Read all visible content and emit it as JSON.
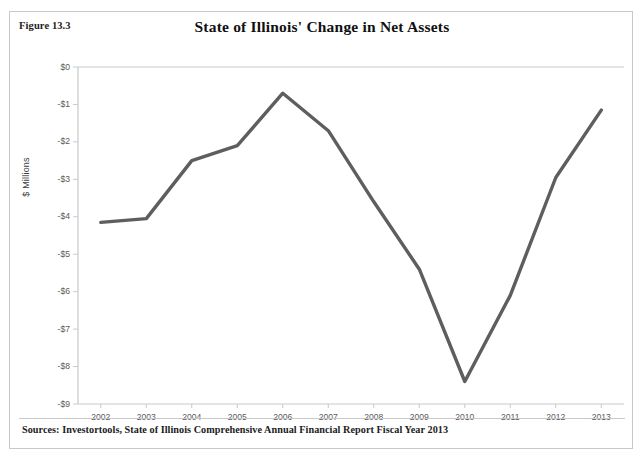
{
  "figure": {
    "label": "Figure 13.3",
    "title": "State of Illinois' Change in Net Assets",
    "sources": "Sources: Investortools, State of Illinois Comprehensive Annual Financial Report Fiscal Year 2013"
  },
  "style": {
    "line_color": "#5e5e5e",
    "axis_color": "#c9c9c9",
    "tick_text_color": "#5a5a5a",
    "border_color": "#c8c8c8",
    "background": "#ffffff"
  },
  "chart_data": {
    "type": "line",
    "title": "State of Illinois' Change in Net Assets",
    "xlabel": "",
    "ylabel": "$ Millions",
    "categories": [
      "2002",
      "2003",
      "2004",
      "2005",
      "2006",
      "2007",
      "2008",
      "2009",
      "2010",
      "2011",
      "2012",
      "2013"
    ],
    "x": [
      2002,
      2003,
      2004,
      2005,
      2006,
      2007,
      2008,
      2009,
      2010,
      2011,
      2012,
      2013
    ],
    "values": [
      -4.15,
      -4.05,
      -2.5,
      -2.1,
      -0.7,
      -1.7,
      -3.6,
      -5.4,
      -8.4,
      -6.1,
      -2.95,
      -1.15
    ],
    "series": [
      {
        "name": "Change in Net Assets",
        "values": [
          -4.15,
          -4.05,
          -2.5,
          -2.1,
          -0.7,
          -1.7,
          -3.6,
          -5.4,
          -8.4,
          -6.1,
          -2.95,
          -1.15
        ]
      }
    ],
    "ylim": [
      -9,
      0
    ],
    "ytick_values": [
      0,
      -1,
      -2,
      -3,
      -4,
      -5,
      -6,
      -7,
      -8,
      -9
    ],
    "ytick_labels": [
      "$0",
      "-$1",
      "-$2",
      "-$3",
      "-$4",
      "-$5",
      "-$6",
      "-$7",
      "-$8",
      "-$9"
    ],
    "grid": false,
    "legend": "none",
    "legend_position": "none",
    "units": "millions"
  }
}
